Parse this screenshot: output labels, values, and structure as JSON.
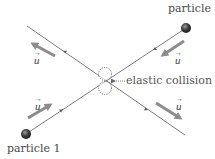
{
  "labels": {
    "particle1": "particle 1",
    "particle2": "particle 2",
    "collision": "elastic collision",
    "velocity_symbol": "u",
    "vector_arrow": "→"
  },
  "colors": {
    "line": "#5a5a5a",
    "velocity_arrow": "#8c8c8c",
    "particle_fill": "#3a3a3a",
    "text": "#4a4a4a"
  },
  "elements": {
    "trajectory_incoming_1": {
      "from": [
        26,
        134
      ],
      "to": [
        105,
        81
      ],
      "direction": "up-right"
    },
    "trajectory_incoming_2": {
      "from": [
        186,
        28
      ],
      "to": [
        105,
        81
      ],
      "direction": "down-left"
    },
    "trajectory_outgoing_1": {
      "from": [
        105,
        81
      ],
      "to": [
        185,
        135
      ],
      "direction": "down-right"
    },
    "trajectory_outgoing_2": {
      "from": [
        105,
        81
      ],
      "to": [
        27,
        26
      ],
      "direction": "up-left"
    },
    "velocity_vectors": [
      {
        "position": "top-left",
        "label": "u",
        "direction": "up-left"
      },
      {
        "position": "top-right",
        "label": "u",
        "direction": "down-left"
      },
      {
        "position": "bottom-left",
        "label": "u",
        "direction": "up-right"
      },
      {
        "position": "bottom-right",
        "label": "u",
        "direction": "down-right"
      }
    ]
  }
}
